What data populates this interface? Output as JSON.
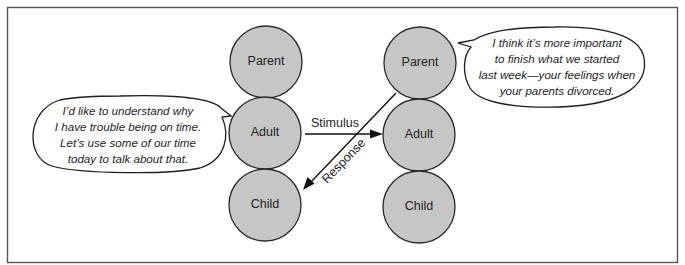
{
  "diagram": {
    "type": "transactional-analysis-crossed-transaction",
    "left_person": {
      "ego_states": [
        "Parent",
        "Adult",
        "Child"
      ],
      "speech": [
        "I’d like to understand why",
        "I have trouble being on time.",
        "Let’s use some of our time",
        "today to talk about that."
      ]
    },
    "right_person": {
      "ego_states": [
        "Parent",
        "Adult",
        "Child"
      ],
      "speech": [
        "I think it’s more important",
        "to finish what we started",
        "last week—your feelings when",
        "your parents divorced."
      ]
    },
    "transactions": [
      {
        "label": "Stimulus",
        "from": "left.Adult",
        "to": "right.Adult"
      },
      {
        "label": "Response",
        "from": "right.Parent",
        "to": "left.Child"
      }
    ],
    "colors": {
      "ego_state_fill": "#c6c6c6",
      "outline": "#1e1e1e"
    }
  }
}
